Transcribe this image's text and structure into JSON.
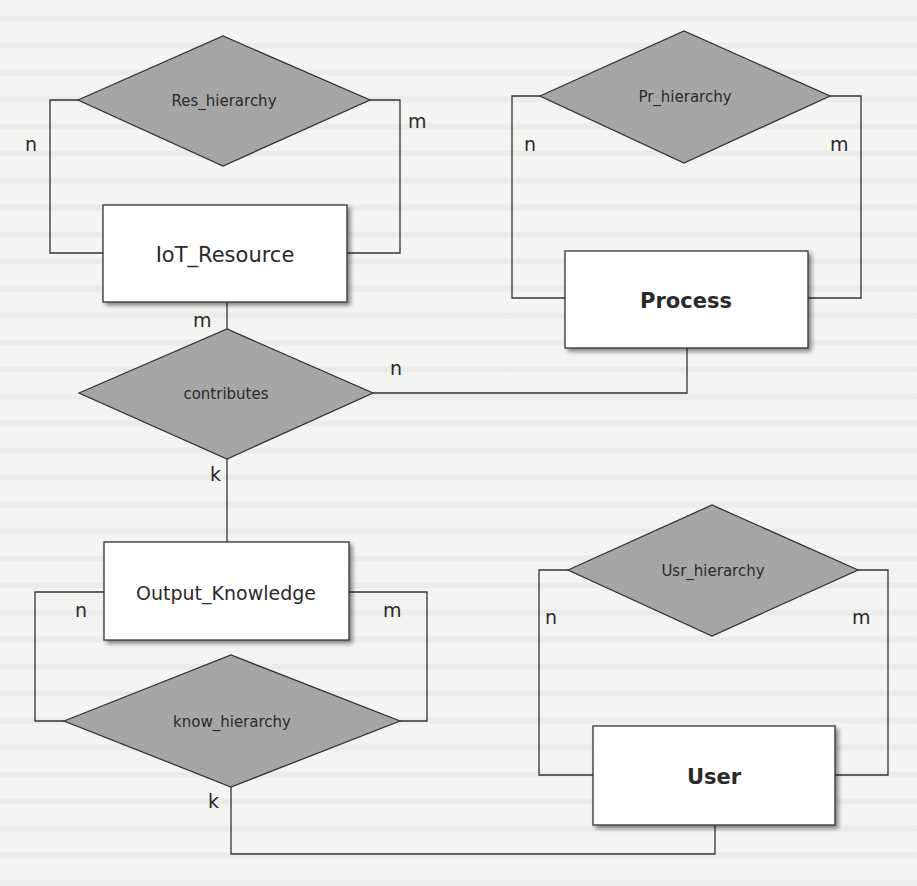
{
  "diagram": {
    "type": "entity-relationship",
    "colors": {
      "background": "#f4f4f2",
      "entity_fill": "#ffffff",
      "relationship_fill": "#a6a6a6",
      "stroke": "#333333",
      "text": "#2a2a2a"
    },
    "entities": [
      {
        "id": "iot_resource",
        "label": "IoT_Resource"
      },
      {
        "id": "process",
        "label": "Process"
      },
      {
        "id": "output_knowledge",
        "label": "Output_Knowledge"
      },
      {
        "id": "user",
        "label": "User"
      }
    ],
    "relationships": [
      {
        "id": "res_hierarchy",
        "label": "Res_hierarchy",
        "connects": [
          "IoT_Resource",
          "IoT_Resource"
        ],
        "cardinalities": [
          "n",
          "m"
        ]
      },
      {
        "id": "pr_hierarchy",
        "label": "Pr_hierarchy",
        "connects": [
          "Process",
          "Process"
        ],
        "cardinalities": [
          "n",
          "m"
        ]
      },
      {
        "id": "contributes",
        "label": "contributes",
        "connects": [
          "IoT_Resource",
          "Process",
          "Output_Knowledge"
        ],
        "cardinalities": [
          "m",
          "n",
          "k"
        ]
      },
      {
        "id": "know_hierarchy",
        "label": "know_hierarchy",
        "connects": [
          "Output_Knowledge",
          "Output_Knowledge",
          "User"
        ],
        "cardinalities": [
          "n",
          "m",
          "k"
        ]
      },
      {
        "id": "usr_hierarchy",
        "label": "Usr_hierarchy",
        "connects": [
          "User",
          "User"
        ],
        "cardinalities": [
          "n",
          "m"
        ]
      }
    ],
    "cardinality_labels": {
      "res_n": "n",
      "res_m": "m",
      "pr_n": "n",
      "pr_m": "m",
      "contrib_m": "m",
      "contrib_n": "n",
      "contrib_k": "k",
      "know_n": "n",
      "know_m": "m",
      "know_k": "k",
      "usr_n": "n",
      "usr_m": "m"
    }
  }
}
